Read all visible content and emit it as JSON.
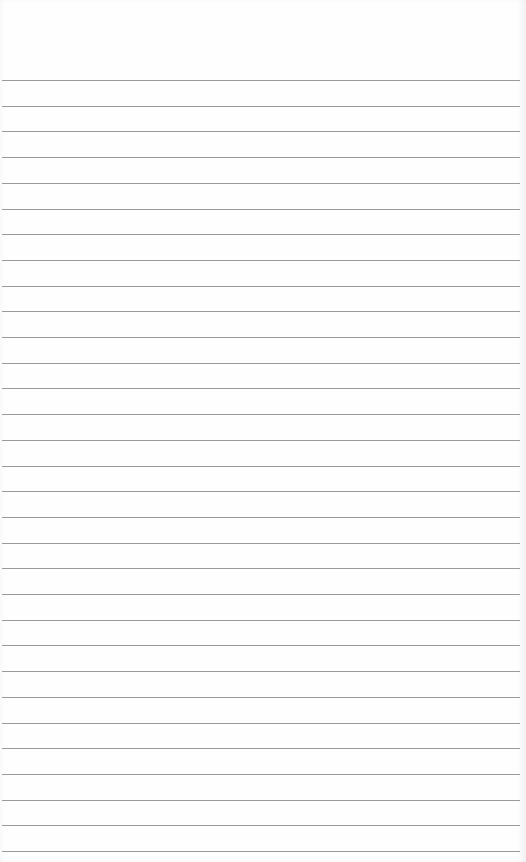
{
  "page": {
    "type": "lined-paper",
    "background_color": "#fefefe",
    "rule_color": "#9a9a9a",
    "first_rule_y": 80,
    "rule_spacing": 25.7,
    "rule_count": 31,
    "text": ""
  }
}
